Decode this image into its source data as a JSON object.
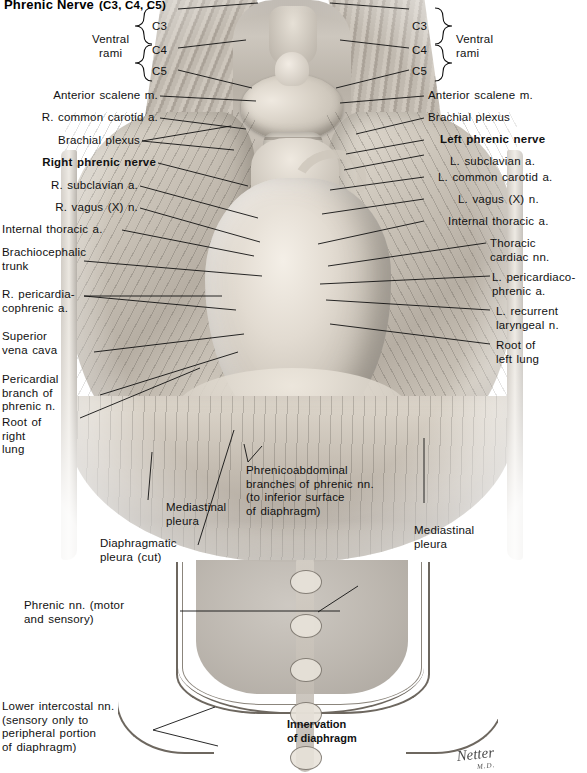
{
  "plate": {
    "title_main": "Phrenic Nerve",
    "title_roots": "(C3, C4, C5)",
    "artist_signature": "Netter",
    "artist_signature_initials": "M.D."
  },
  "braces": {
    "left_label": "Ventral\nrami",
    "right_label": "Ventral\nrami",
    "roots": [
      "C3",
      "C4",
      "C5"
    ]
  },
  "left_labels": [
    {
      "id": "anterior-scalene-m",
      "text": "Anterior scalene m.",
      "bold": false
    },
    {
      "id": "r-common-carotid-a",
      "text": "R. common carotid a.",
      "bold": false
    },
    {
      "id": "brachial-plexus",
      "text": "Brachial plexus",
      "bold": false
    },
    {
      "id": "right-phrenic-nerve",
      "text": "Right phrenic nerve",
      "bold": true
    },
    {
      "id": "r-subclavian-a",
      "text": "R. subclavian a.",
      "bold": false
    },
    {
      "id": "r-vagus-x-n",
      "text": "R. vagus (X) n.",
      "bold": false
    },
    {
      "id": "internal-thoracic-a",
      "text": "Internal thoracic a.",
      "bold": false
    },
    {
      "id": "brachiocephalic-trunk",
      "text": "Brachiocephalic\ntrunk",
      "bold": false
    },
    {
      "id": "r-pericardiacophrenic-a",
      "text": "R. pericardia-\ncophrenic a.",
      "bold": false
    },
    {
      "id": "superior-vena-cava",
      "text": "Superior\nvena cava",
      "bold": false
    },
    {
      "id": "pericardial-branch-of-phrenic-n",
      "text": "Pericardial\nbranch of\nphrenic n.",
      "bold": false
    },
    {
      "id": "root-of-right-lung",
      "text": "Root of\nright\nlung",
      "bold": false
    },
    {
      "id": "diaphragmatic-pleura-cut",
      "text": "Diaphragmatic\npleura (cut)",
      "bold": false
    }
  ],
  "right_labels": [
    {
      "id": "anterior-scalene-m-right",
      "text": "Anterior scalene m.",
      "bold": false
    },
    {
      "id": "brachial-plexus-right",
      "text": "Brachial plexus",
      "bold": false
    },
    {
      "id": "left-phrenic-nerve",
      "text": "Left phrenic nerve",
      "bold": true
    },
    {
      "id": "l-subclavian-a",
      "text": "L. subclavian a.",
      "bold": false
    },
    {
      "id": "l-common-carotid-a",
      "text": "L. common carotid a.",
      "bold": false
    },
    {
      "id": "l-vagus-x-n",
      "text": "L. vagus (X) n.",
      "bold": false
    },
    {
      "id": "internal-thoracic-a-left",
      "text": "Internal thoracic a.",
      "bold": false
    },
    {
      "id": "thoracic-cardiac-nn",
      "text": "Thoracic\ncardiac nn.",
      "bold": false
    },
    {
      "id": "l-pericardiacophrenic-a",
      "text": "L. pericardiaco-\nphrenic a.",
      "bold": false
    },
    {
      "id": "l-recurrent-laryngeal-n",
      "text": "L. recurrent\nlaryngeal n.",
      "bold": false
    },
    {
      "id": "root-of-left-lung",
      "text": "Root of\nleft lung",
      "bold": false
    }
  ],
  "center_labels": [
    {
      "id": "phrenicoabdominal-branches",
      "text": "Phrenicoabdominal\nbranches of phrenic nn.\n(to inferior surface\nof diaphragm)",
      "bold": false
    },
    {
      "id": "mediastinal-pleura-left",
      "text": "Mediastinal\npleura",
      "bold": false
    },
    {
      "id": "mediastinal-pleura-right",
      "text": "Mediastinal\npleura",
      "bold": false
    }
  ],
  "lower_panel": {
    "caption": "Innervation\nof diaphragm",
    "labels": [
      {
        "id": "phrenic-nn-motor-and-sensory",
        "text": "Phrenic nn. (motor\nand sensory)"
      },
      {
        "id": "lower-intercostal-nn",
        "text": "Lower intercostal nn.\n(sensory only to\nperipheral portion\nof diaphragm)"
      }
    ]
  },
  "colors": {
    "ink": "#111111",
    "leader": "#111111",
    "paper": "#ffffff",
    "wash_mid": "#b8b1a7",
    "wash_light": "#e4ded4",
    "wash_dark": "#8f887f"
  }
}
